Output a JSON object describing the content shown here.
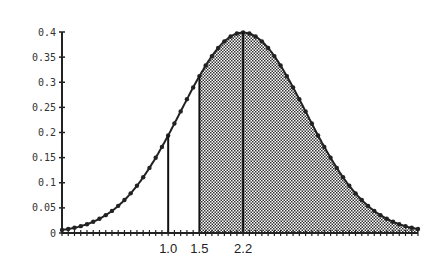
{
  "chart_data": {
    "type": "area",
    "title": "",
    "xlabel": "",
    "ylabel": "",
    "ylim": [
      0,
      0.4
    ],
    "xlim": [
      -0.7,
      5.0
    ],
    "grid": false,
    "legend": null,
    "distribution": {
      "name": "normal",
      "mean": 2.2,
      "sd": 1.0
    },
    "y_ticks": [
      "0",
      "0.05",
      "0.1",
      "0.15",
      "0.2",
      "0.25",
      "0.3",
      "0.35",
      "0.4"
    ],
    "x_tick_labels": [
      "1.0",
      "1.5",
      "2.2"
    ],
    "vertical_lines": [
      {
        "x": 1.0,
        "y": 0.194
      },
      {
        "x": 1.5,
        "y": 0.312
      },
      {
        "x": 2.2,
        "y": 0.399
      }
    ],
    "shaded_region": {
      "from": 1.5,
      "to": 5.0
    },
    "series": [
      {
        "name": "density",
        "x": [
          -0.7,
          -0.5,
          -0.3,
          -0.1,
          0.1,
          0.3,
          0.5,
          0.7,
          0.9,
          1.1,
          1.3,
          1.5,
          1.7,
          1.9,
          2.1,
          2.2,
          2.3,
          2.5,
          2.7,
          2.9,
          3.1,
          3.3,
          3.5,
          3.7,
          3.9,
          4.1,
          4.3,
          4.5,
          4.7,
          4.9
        ],
        "values": [
          0.006,
          0.01,
          0.018,
          0.028,
          0.044,
          0.066,
          0.094,
          0.13,
          0.171,
          0.218,
          0.266,
          0.312,
          0.352,
          0.381,
          0.397,
          0.399,
          0.397,
          0.381,
          0.352,
          0.312,
          0.266,
          0.218,
          0.171,
          0.13,
          0.094,
          0.066,
          0.044,
          0.028,
          0.018,
          0.01
        ]
      }
    ]
  }
}
